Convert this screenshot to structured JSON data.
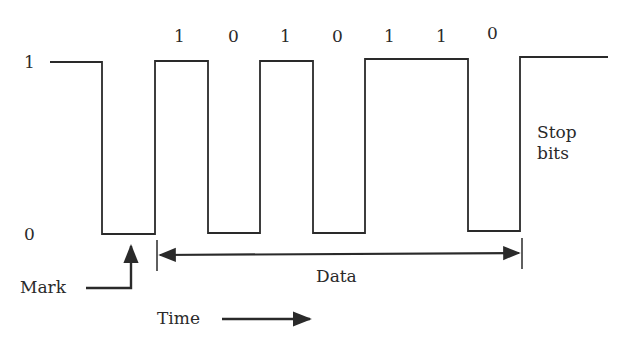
{
  "diagram": {
    "type": "serial-waveform",
    "y_axis": {
      "high_label": "1",
      "low_label": "0"
    },
    "bits": [
      "1",
      "0",
      "1",
      "0",
      "1",
      "1",
      "0"
    ],
    "labels": {
      "stop_line1": "Stop",
      "stop_line2": "bits",
      "mark": "Mark",
      "data": "Data",
      "time": "Time"
    },
    "colors": {
      "line": "#2a2a2a",
      "background": "#ffffff"
    }
  }
}
